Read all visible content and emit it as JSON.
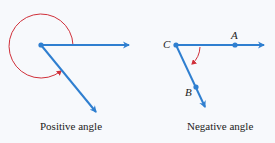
{
  "colors": {
    "ray": "#2f7fd0",
    "arc": "#d0303a",
    "background": "#f7f9fc",
    "text": "#222222"
  },
  "diagrams": [
    {
      "caption": "Positive angle",
      "vertex": [
        41,
        45
      ],
      "rays": [
        [
          130,
          45
        ],
        [
          97,
          113
        ]
      ],
      "arc": "counterclockwise, large (reflex)"
    },
    {
      "caption": "Negative angle",
      "vertex": [
        176,
        45
      ],
      "rays": [
        [
          265,
          45
        ],
        [
          206,
          108
        ]
      ],
      "points": [
        {
          "label": "C",
          "pos": [
            176,
            45
          ]
        },
        {
          "label": "A",
          "pos": [
            235,
            45
          ]
        },
        {
          "label": "B",
          "pos": [
            196,
            87
          ]
        }
      ],
      "arc": "clockwise, small"
    }
  ]
}
